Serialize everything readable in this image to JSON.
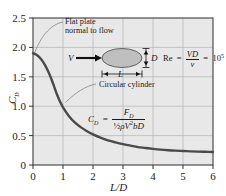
{
  "chart_data": {
    "type": "line",
    "title": "",
    "xlabel": "L/D",
    "ylabel": "CD",
    "xlim": [
      0,
      6
    ],
    "ylim": [
      0,
      2.5
    ],
    "grid": true,
    "legend": "none",
    "x_ticks": [
      "0",
      "1",
      "2",
      "3",
      "4",
      "5",
      "6"
    ],
    "y_ticks": [
      "0",
      "0.5",
      "1.0",
      "1.5",
      "2.0",
      "2.5"
    ],
    "series": [
      {
        "name": "Drag coefficient of elliptical cylinder",
        "x": [
          0,
          0.1,
          0.2,
          0.3,
          0.4,
          0.5,
          0.6,
          0.7,
          0.8,
          0.9,
          1.0,
          1.2,
          1.4,
          1.6,
          1.8,
          2.0,
          2.25,
          2.5,
          2.75,
          3.0,
          3.25,
          3.5,
          3.75,
          4.0,
          4.25,
          4.5,
          4.75,
          5.0,
          5.25,
          5.5,
          5.75,
          6.0
        ],
        "y": [
          1.9,
          1.88,
          1.84,
          1.78,
          1.7,
          1.6,
          1.48,
          1.34,
          1.2,
          1.08,
          0.98,
          0.83,
          0.72,
          0.64,
          0.575,
          0.52,
          0.465,
          0.42,
          0.385,
          0.355,
          0.33,
          0.305,
          0.29,
          0.275,
          0.262,
          0.252,
          0.244,
          0.238,
          0.232,
          0.228,
          0.225,
          0.222
        ]
      }
    ],
    "annotations": [
      {
        "name": "flat-plate-note",
        "text_line1": "Flat plate",
        "text_line2": "normal to flow",
        "points_to_x": 0.0,
        "points_to_y": 1.9
      },
      {
        "name": "circular-cylinder-note",
        "text": "Circular cylinder",
        "points_to_x": 1.0,
        "points_to_y": 0.98
      }
    ],
    "equations": [
      {
        "name": "reynolds-number",
        "lhs": "Re",
        "numerator": "VD",
        "denominator": "ν",
        "rhs": "10",
        "rhs_exponent": "5"
      },
      {
        "name": "drag-coefficient-definition",
        "lhs": "CD",
        "numerator": "FD",
        "denominator": "½ρV²bD"
      }
    ],
    "schematic": {
      "name": "elliptical-cylinder-diagram",
      "flow_label": "V",
      "height_label": "D",
      "length_label": "L",
      "body_shape": "ellipse",
      "body_fill": "#bfbfbf"
    },
    "colors": {
      "curve": "#4a4a4a",
      "plot_background": "#e8e8e8",
      "grid": "#b0b0b0",
      "frame": "#555555",
      "text": "#1a1a1a"
    }
  }
}
